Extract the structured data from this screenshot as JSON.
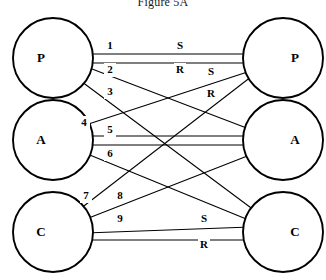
{
  "figure": {
    "title": "Figure 5A",
    "width": 326,
    "height": 280,
    "ink_color": "#000000",
    "paper_color": "#ffffff"
  },
  "nodes": {
    "left": [
      {
        "id": "left-p",
        "label": "P",
        "cx": 53,
        "cy": 58,
        "r": 40
      },
      {
        "id": "left-a",
        "label": "A",
        "cx": 53,
        "cy": 140,
        "r": 40
      },
      {
        "id": "left-c",
        "label": "C",
        "cx": 53,
        "cy": 232,
        "r": 40
      }
    ],
    "right": [
      {
        "id": "right-p",
        "label": "P",
        "cx": 283,
        "cy": 58,
        "r": 40
      },
      {
        "id": "right-a",
        "label": "A",
        "cx": 283,
        "cy": 140,
        "r": 40
      },
      {
        "id": "right-c",
        "label": "C",
        "cx": 283,
        "cy": 232,
        "r": 40
      }
    ]
  },
  "edges": [
    {
      "id": "edge-1",
      "label": "1",
      "from": "left-p",
      "to": "right-p",
      "x1": 58,
      "y1": 54,
      "x2": 278,
      "y2": 54,
      "lx": 110,
      "ly": 46
    },
    {
      "id": "edge-2",
      "label": "2",
      "from": "left-p",
      "to": "right-p",
      "x1": 58,
      "y1": 63,
      "x2": 278,
      "y2": 63,
      "lx": 110,
      "ly": 70
    },
    {
      "id": "edge-3",
      "label": "3",
      "from": "left-p",
      "to": "right-a",
      "x1": 58,
      "y1": 56,
      "x2": 278,
      "y2": 140,
      "lx": 110,
      "ly": 92
    },
    {
      "id": "edge-4",
      "label": "4",
      "from": "left-p",
      "to": "right-c",
      "x1": 58,
      "y1": 64,
      "x2": 278,
      "y2": 228,
      "lx": 84,
      "ly": 123
    },
    {
      "id": "edge-5",
      "label": "5",
      "from": "left-a",
      "to": "right-a",
      "x1": 58,
      "y1": 136,
      "x2": 278,
      "y2": 136,
      "lx": 110,
      "ly": 130
    },
    {
      "id": "edge-6",
      "label": "6",
      "from": "left-a",
      "to": "right-a",
      "x1": 58,
      "y1": 145,
      "x2": 278,
      "y2": 145,
      "lx": 110,
      "ly": 154
    },
    {
      "id": "edge-7",
      "label": "7",
      "from": "left-c",
      "to": "right-p",
      "x1": 58,
      "y1": 226,
      "x2": 278,
      "y2": 56,
      "lx": 86,
      "ly": 196
    },
    {
      "id": "edge-8",
      "label": "8",
      "from": "left-c",
      "to": "right-a",
      "x1": 58,
      "y1": 230,
      "x2": 278,
      "y2": 144,
      "lx": 120,
      "ly": 196
    },
    {
      "id": "edge-9",
      "label": "9",
      "from": "left-c",
      "to": "right-c",
      "x1": 58,
      "y1": 234,
      "x2": 278,
      "y2": 226,
      "lx": 120,
      "ly": 219
    },
    {
      "id": "edge-a-up",
      "label": "",
      "from": "left-a",
      "to": "right-p",
      "x1": 58,
      "y1": 134,
      "x2": 278,
      "y2": 62,
      "lx": 0,
      "ly": 0
    },
    {
      "id": "edge-a-down",
      "label": "",
      "from": "left-a",
      "to": "right-c",
      "x1": 58,
      "y1": 142,
      "x2": 278,
      "y2": 232,
      "lx": 0,
      "ly": 0
    },
    {
      "id": "edge-c-bottom",
      "label": "",
      "from": "left-c",
      "to": "right-c",
      "x1": 58,
      "y1": 240,
      "x2": 278,
      "y2": 240,
      "lx": 0,
      "ly": 0
    }
  ],
  "direction_markers": [
    {
      "id": "marker-s-top",
      "label": "S",
      "x": 180,
      "y": 46
    },
    {
      "id": "marker-r-top",
      "label": "R",
      "x": 180,
      "y": 70
    },
    {
      "id": "marker-s-upper-right",
      "label": "S",
      "x": 211,
      "y": 72
    },
    {
      "id": "marker-r-upper-right",
      "label": "R",
      "x": 211,
      "y": 94
    },
    {
      "id": "marker-s-bottom",
      "label": "S",
      "x": 204,
      "y": 219
    },
    {
      "id": "marker-r-bottom",
      "label": "R",
      "x": 204,
      "y": 245
    }
  ]
}
